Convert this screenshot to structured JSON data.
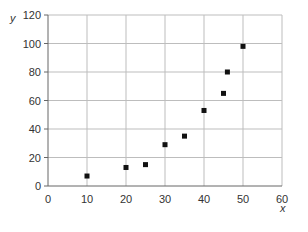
{
  "chart_data": {
    "type": "scatter",
    "title": "",
    "xlabel": "x",
    "ylabel": "y",
    "xlim": [
      0,
      60
    ],
    "ylim": [
      0,
      120
    ],
    "x_ticks": [
      0,
      10,
      20,
      30,
      40,
      50,
      60
    ],
    "y_ticks": [
      0,
      20,
      40,
      60,
      80,
      100,
      120
    ],
    "grid": true,
    "legend": null,
    "series": [
      {
        "name": "data",
        "marker": "square",
        "color": "#111111",
        "points": [
          {
            "x": 10,
            "y": 7
          },
          {
            "x": 20,
            "y": 13
          },
          {
            "x": 25,
            "y": 15
          },
          {
            "x": 30,
            "y": 29
          },
          {
            "x": 35,
            "y": 35
          },
          {
            "x": 40,
            "y": 53
          },
          {
            "x": 45,
            "y": 65
          },
          {
            "x": 46,
            "y": 80
          },
          {
            "x": 50,
            "y": 98
          }
        ]
      }
    ]
  },
  "colors": {
    "grid": "#bdbdbd",
    "axis": "#666666",
    "marker": "#111111"
  }
}
